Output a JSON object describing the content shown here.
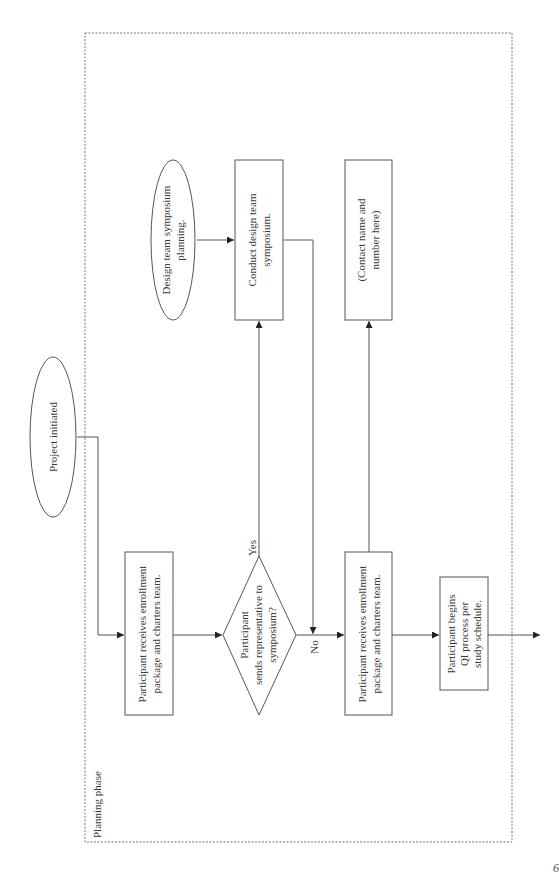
{
  "diagram": {
    "orientation": "rotated-90-ccw",
    "phase_label": "Planning phase",
    "colors": {
      "stroke": "#555555",
      "dashed_border": "#777777",
      "text": "#3a3a3a",
      "background": "#ffffff"
    },
    "nodes": {
      "project_initiated": {
        "shape": "ellipse",
        "lines": [
          "Project initiated"
        ]
      },
      "enrollment_1": {
        "shape": "rect",
        "lines": [
          "Participant receives enrollment",
          "package and charters team."
        ]
      },
      "decision": {
        "shape": "diamond",
        "lines": [
          "Participant",
          "sends representative to",
          "symposium?"
        ]
      },
      "design_planning": {
        "shape": "ellipse",
        "lines": [
          "Design team symposium",
          "planning."
        ]
      },
      "conduct_symposium": {
        "shape": "rect",
        "lines": [
          "Conduct design team",
          "symposium."
        ]
      },
      "enrollment_2": {
        "shape": "rect",
        "lines": [
          "Participant receives enrollment",
          "package and charters team."
        ]
      },
      "contact": {
        "shape": "rect",
        "lines": [
          "(Contact name and",
          "number here)"
        ]
      },
      "qi_process": {
        "shape": "rect",
        "lines": [
          "Participant begins",
          "QI process per",
          "study schedule."
        ]
      }
    },
    "edge_labels": {
      "yes": "Yes",
      "no": "No"
    },
    "edges": [
      {
        "from": "project_initiated",
        "to": "enrollment_1"
      },
      {
        "from": "enrollment_1",
        "to": "decision"
      },
      {
        "from": "decision",
        "to": "conduct_symposium",
        "label": "Yes"
      },
      {
        "from": "design_planning",
        "to": "conduct_symposium"
      },
      {
        "from": "conduct_symposium",
        "to": "enrollment_2"
      },
      {
        "from": "decision",
        "to": "enrollment_2",
        "label": "No"
      },
      {
        "from": "enrollment_2",
        "to": "contact"
      },
      {
        "from": "enrollment_2",
        "to": "qi_process"
      },
      {
        "from": "qi_process",
        "to": "next"
      }
    ]
  },
  "page": {
    "number_fragment": "6"
  }
}
